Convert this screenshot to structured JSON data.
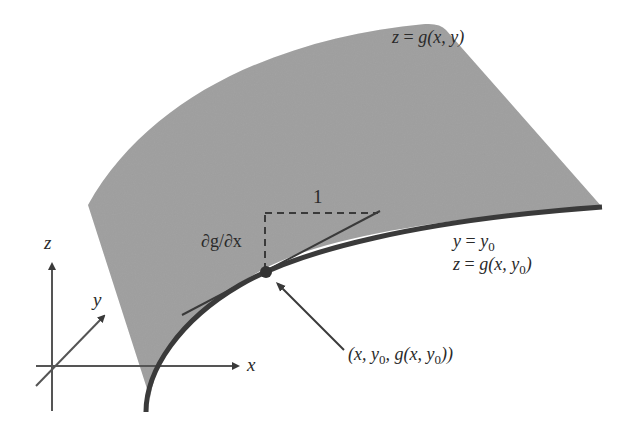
{
  "figure": {
    "type": "partial-derivative-surface-diagram",
    "colors": {
      "surface": "#9d9d9d",
      "curve": "#3a3a3a",
      "lines": "#3a3a3a",
      "text": "#2a2a2a",
      "background": "#ffffff"
    },
    "labels": {
      "surface_eq": {
        "lhs": "z",
        "eq": " = ",
        "fn": "g",
        "args": "(x, y)"
      },
      "slice_y": {
        "lhs": "y",
        "eq": " = ",
        "var": "y",
        "sub": "0"
      },
      "slice_z": {
        "lhs": "z",
        "eq": " = ",
        "fn": "g",
        "open": "(x, ",
        "var": "y",
        "sub": "0",
        "close": ")"
      },
      "point": {
        "open": "(x, ",
        "var1": "y",
        "sub1": "0",
        "mid": ", g(x, ",
        "var2": "y",
        "sub2": "0",
        "close": "))"
      },
      "partial": "∂g/∂x",
      "run": "1"
    },
    "axes": {
      "x_label": "x",
      "y_label": "y",
      "z_label": "z"
    }
  }
}
